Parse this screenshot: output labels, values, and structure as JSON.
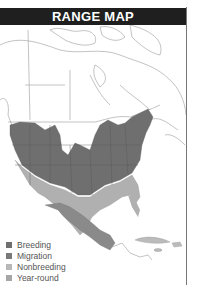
{
  "header": {
    "title": "RANGE MAP"
  },
  "colors": {
    "breeding": "#6f6f6f",
    "migration": "#7a7a7a",
    "nonbreeding": "#b4b4b4",
    "year_round": "#a8a8a8",
    "header_bg": "#1f1f1f",
    "land": "#ffffff",
    "border_lines": "#999999"
  },
  "legend": {
    "items": [
      {
        "label": "Breeding",
        "color": "#6f6f6f"
      },
      {
        "label": "Migration",
        "color": "#7a7a7a"
      },
      {
        "label": "Nonbreeding",
        "color": "#b8b8b8"
      },
      {
        "label": "Year-round",
        "color": "#a6a6a6"
      }
    ]
  }
}
